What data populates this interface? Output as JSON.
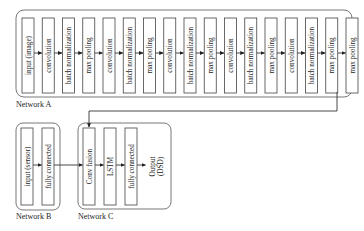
{
  "network_a": {
    "label": "Network A",
    "layers": [
      "input (image)",
      "convolution",
      "batch normalization",
      "max pooling",
      "convolution",
      "batch normalization",
      "max pooling",
      "convolution",
      "batch normalization",
      "max pooling",
      "convolution",
      "batch normalization",
      "max pooling",
      "convolution",
      "batch normalization",
      "max pooling",
      "max pooling"
    ]
  },
  "network_b": {
    "label": "Network B",
    "layers": [
      "input (sensor)",
      "fully connected"
    ]
  },
  "network_c": {
    "label": "Network C",
    "layers": [
      "Conv fusion",
      "LSTM",
      "fully connected"
    ],
    "output_line1": "Output",
    "output_line2": "(DSD)"
  }
}
